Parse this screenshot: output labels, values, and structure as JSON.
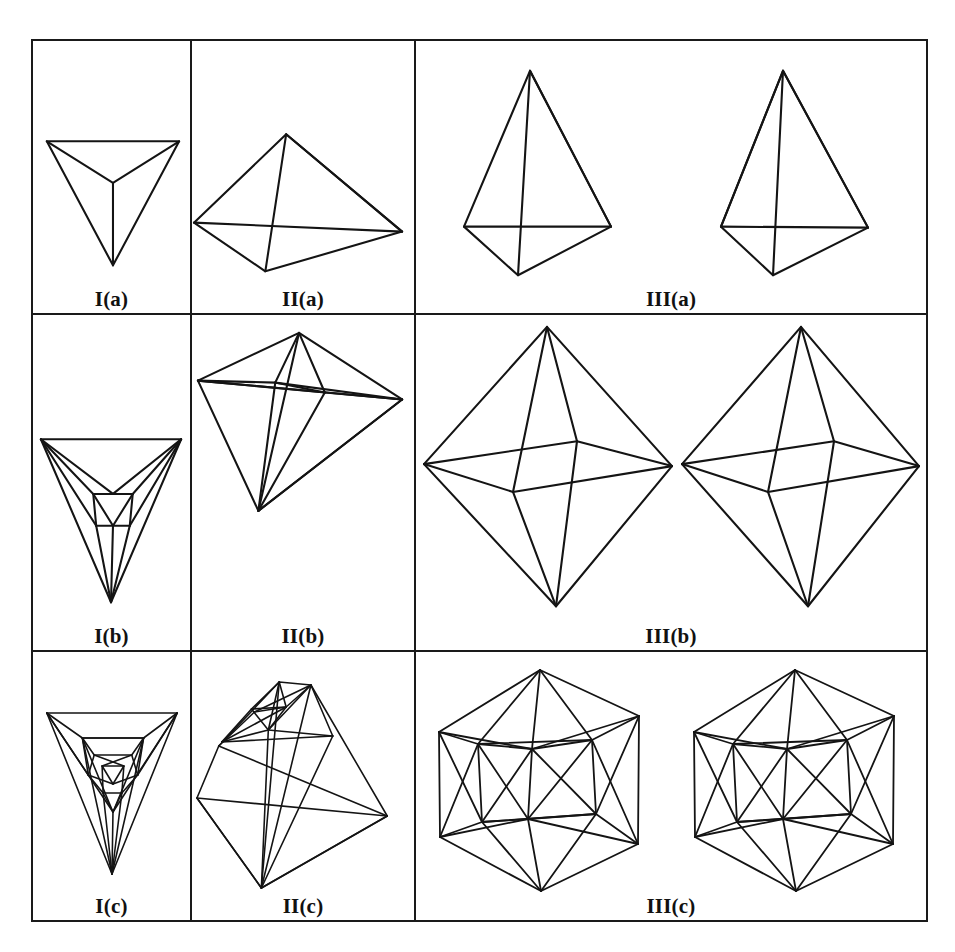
{
  "figure": {
    "caption_rows": [
      "a",
      "b",
      "c"
    ],
    "caption_cols": [
      "I",
      "II",
      "III"
    ],
    "grid": {
      "rows": 3,
      "cols": 3,
      "stroke_color": "#141414",
      "background_color": "#ffffff",
      "border_width_px": 2
    },
    "panels": [
      {
        "id": "I-a",
        "label": "I(a)",
        "row": 0,
        "col": 0,
        "shape": "tetrahedron-axial-view",
        "views": 1,
        "vertices": 4,
        "edges": 6
      },
      {
        "id": "II-a",
        "label": "II(a)",
        "row": 0,
        "col": 1,
        "shape": "tetrahedron-oblique-view",
        "views": 1,
        "vertices": 4,
        "edges": 6
      },
      {
        "id": "III-a",
        "label": "III(a)",
        "row": 0,
        "col": 2,
        "shape": "tetrahedron-stereo-pair",
        "views": 2,
        "vertices": 4,
        "edges": 6
      },
      {
        "id": "I-b",
        "label": "I(b)",
        "row": 1,
        "col": 0,
        "shape": "capped-tetrahedron-axial-view",
        "views": 1,
        "vertices": 7,
        "edges": 15
      },
      {
        "id": "II-b",
        "label": "II(b)",
        "row": 1,
        "col": 1,
        "shape": "capped-tetrahedron-oblique-view",
        "views": 1,
        "vertices": 7,
        "edges": 15
      },
      {
        "id": "III-b",
        "label": "III(b)",
        "row": 1,
        "col": 2,
        "shape": "octahedron-stereo-pair",
        "views": 2,
        "vertices": 6,
        "edges": 12
      },
      {
        "id": "I-c",
        "label": "I(c)",
        "row": 2,
        "col": 0,
        "shape": "nested-tetrahedral-cluster-axial-view",
        "views": 1,
        "vertices": 13,
        "edges": 30
      },
      {
        "id": "II-c",
        "label": "II(c)",
        "row": 2,
        "col": 1,
        "shape": "nested-tetrahedral-cluster-oblique-view",
        "views": 1,
        "vertices": 13,
        "edges": 30
      },
      {
        "id": "III-c",
        "label": "III(c)",
        "row": 2,
        "col": 2,
        "shape": "icosahedron-stereo-pair",
        "views": 2,
        "vertices": 12,
        "edges": 30
      }
    ]
  }
}
